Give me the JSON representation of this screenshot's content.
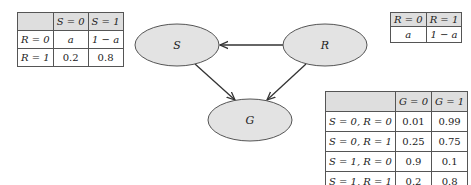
{
  "graph": {
    "nodes": [
      {
        "id": "S",
        "label": "S"
      },
      {
        "id": "R",
        "label": "R"
      },
      {
        "id": "G",
        "label": "G"
      }
    ],
    "edges": [
      {
        "from": "R",
        "to": "S"
      },
      {
        "from": "S",
        "to": "G"
      },
      {
        "from": "R",
        "to": "G"
      }
    ],
    "node_fill": "#e3e3e3",
    "node_stroke": "#555555",
    "edge_color": "#333333"
  },
  "table_s_given_r": {
    "header": [
      "",
      "S = 0",
      "S = 1"
    ],
    "rows": [
      [
        "R = 0",
        "a",
        "1 − a"
      ],
      [
        "R = 1",
        "0.2",
        "0.8"
      ]
    ]
  },
  "table_r": {
    "header": [
      "R = 0",
      "R = 1"
    ],
    "rows": [
      [
        "a",
        "1 − a"
      ]
    ]
  },
  "table_g_given_sr": {
    "header": [
      "",
      "G = 0",
      "G = 1"
    ],
    "rows": [
      [
        "S = 0, R = 0",
        "0.01",
        "0.99"
      ],
      [
        "S = 0, R = 1",
        "0.25",
        "0.75"
      ],
      [
        "S = 1, R = 0",
        "0.9",
        "0.1"
      ],
      [
        "S = 1, R = 1",
        "0.2",
        "0.8"
      ]
    ]
  }
}
